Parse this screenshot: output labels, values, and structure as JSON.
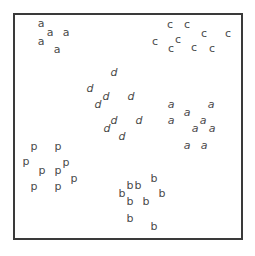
{
  "figure": {
    "frame": {
      "left": 13,
      "top": 13,
      "right": 241,
      "bottom": 238,
      "border_color": "#3a3a3a"
    },
    "glyph_color": "#4a4a4a",
    "clusters": [
      {
        "name": "a-upright",
        "letter": "a",
        "style": "normal",
        "points": [
          [
            41,
            24
          ],
          [
            50,
            33
          ],
          [
            66,
            33
          ],
          [
            41,
            42
          ],
          [
            57,
            50
          ]
        ]
      },
      {
        "name": "c",
        "letter": "c",
        "style": "normal",
        "points": [
          [
            170,
            25
          ],
          [
            187,
            25
          ],
          [
            204,
            34
          ],
          [
            228,
            34
          ],
          [
            155,
            42
          ],
          [
            178,
            40
          ],
          [
            171,
            49
          ],
          [
            194,
            48
          ],
          [
            212,
            49
          ]
        ]
      },
      {
        "name": "d",
        "letter": "d",
        "style": "italic",
        "points": [
          [
            114,
            73
          ],
          [
            90,
            89
          ],
          [
            106,
            97
          ],
          [
            98,
            105
          ],
          [
            131,
            97
          ],
          [
            114,
            121
          ],
          [
            107,
            129
          ],
          [
            139,
            121
          ],
          [
            122,
            137
          ]
        ]
      },
      {
        "name": "a-italic",
        "letter": "a",
        "style": "italic",
        "points": [
          [
            171,
            105
          ],
          [
            211,
            105
          ],
          [
            187,
            113
          ],
          [
            171,
            121
          ],
          [
            203,
            121
          ],
          [
            195,
            129
          ],
          [
            212,
            129
          ],
          [
            187,
            146
          ],
          [
            204,
            146
          ]
        ]
      },
      {
        "name": "p",
        "letter": "p",
        "style": "normal",
        "points": [
          [
            34,
            147
          ],
          [
            58,
            147
          ],
          [
            26,
            162
          ],
          [
            42,
            171
          ],
          [
            58,
            171
          ],
          [
            66,
            163
          ],
          [
            74,
            179
          ],
          [
            34,
            187
          ],
          [
            58,
            187
          ]
        ]
      },
      {
        "name": "b",
        "letter": "b",
        "style": "normal",
        "points": [
          [
            154,
            179
          ],
          [
            130,
            186
          ],
          [
            138,
            186
          ],
          [
            122,
            194
          ],
          [
            162,
            194
          ],
          [
            130,
            202
          ],
          [
            146,
            202
          ],
          [
            130,
            219
          ],
          [
            154,
            227
          ]
        ]
      }
    ]
  }
}
